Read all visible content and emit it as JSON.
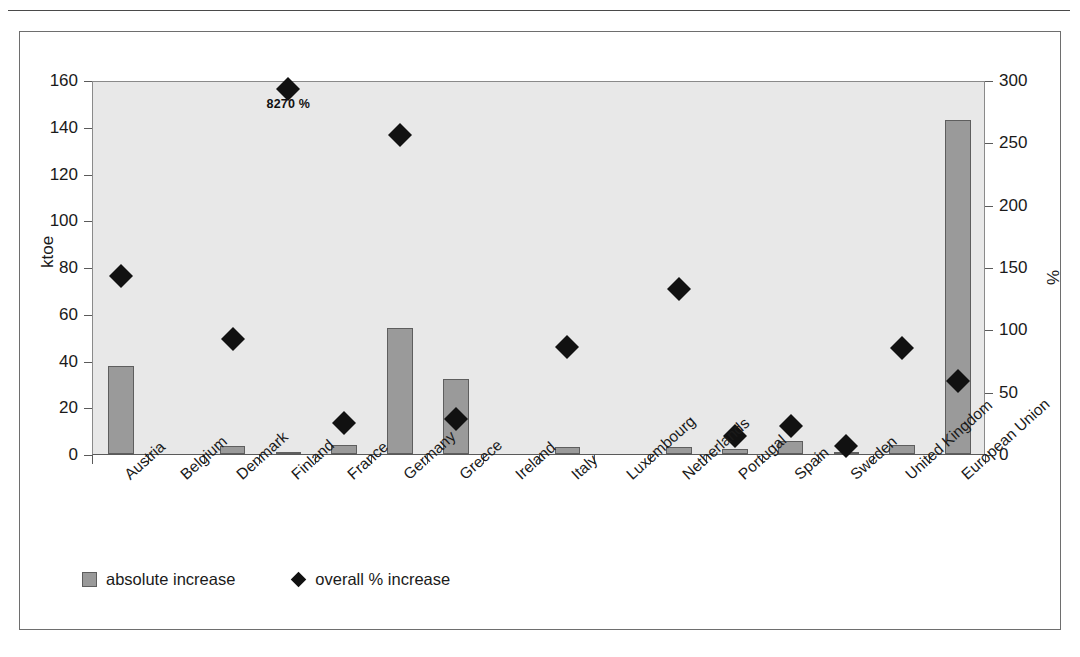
{
  "figure": {
    "left_axis_title": "ktoe",
    "right_axis_title": "%",
    "annotation": "8270 %"
  },
  "legend": {
    "items": [
      {
        "label": "absolute increase",
        "marker": "bar-swatch",
        "color": "#9a9a9a"
      },
      {
        "label": "overall % increase",
        "marker": "diamond-swatch",
        "color": "#111111"
      }
    ]
  },
  "chart_data": {
    "type": "bar",
    "title": "",
    "xlabel": "",
    "ylabel": "ktoe",
    "y2label": "%",
    "ylim": [
      0,
      160
    ],
    "y2lim": [
      0,
      300
    ],
    "yticks": [
      0,
      20,
      40,
      60,
      80,
      100,
      120,
      140,
      160
    ],
    "y2ticks": [
      0,
      50,
      100,
      150,
      200,
      250,
      300
    ],
    "grid": false,
    "legend_position": "bottom-left",
    "categories": [
      "Austria",
      "Belgium",
      "Denmark",
      "Finland",
      "France",
      "Germany",
      "Greece",
      "Ireland",
      "Italy",
      "Luxembourg",
      "Netherlands",
      "Portugal",
      "Spain",
      "Sweden",
      "United Kingdom",
      "European Union"
    ],
    "series": [
      {
        "name": "absolute increase",
        "axis": "left",
        "unit": "ktoe",
        "type": "bar",
        "color": "#9a9a9a",
        "values": [
          37.5,
          0,
          3.5,
          0.3,
          4,
          54,
          32,
          0,
          3,
          0,
          3.2,
          2,
          5.5,
          0.5,
          3.8,
          143
        ]
      },
      {
        "name": "overall % increase",
        "axis": "right",
        "unit": "%",
        "type": "scatter",
        "marker": "diamond",
        "color": "#111111",
        "values": [
          150,
          null,
          99,
          300,
          32,
          263,
          35,
          null,
          93,
          null,
          139,
          21,
          29,
          13,
          92,
          65
        ]
      }
    ],
    "annotations": [
      {
        "category": "Finland",
        "text": "8270 %",
        "series": "overall % increase",
        "note": "true value exceeds axis maximum of 300 %"
      }
    ]
  },
  "axis": {
    "left_ticks": [
      "0",
      "20",
      "40",
      "60",
      "80",
      "100",
      "120",
      "140",
      "160"
    ],
    "right_ticks": [
      "0",
      "50",
      "100",
      "150",
      "200",
      "250",
      "300"
    ]
  }
}
